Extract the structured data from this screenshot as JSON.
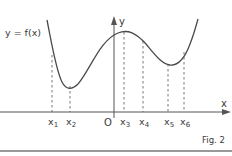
{
  "figure": {
    "function_label": "y = f(x)",
    "y_axis_label": "y",
    "x_axis_label": "x",
    "origin_label": "O",
    "caption": "Fig. 2",
    "x_points": [
      {
        "name": "x",
        "sub": "1"
      },
      {
        "name": "x",
        "sub": "2"
      },
      {
        "name": "x",
        "sub": "3"
      },
      {
        "name": "x",
        "sub": "4"
      },
      {
        "name": "x",
        "sub": "5"
      },
      {
        "name": "x",
        "sub": "6"
      }
    ],
    "colors": {
      "curve": "#4a4a4a",
      "axis": "#555555",
      "dashed": "#666666",
      "text": "#3a3a3a",
      "rule": "#777777"
    }
  }
}
